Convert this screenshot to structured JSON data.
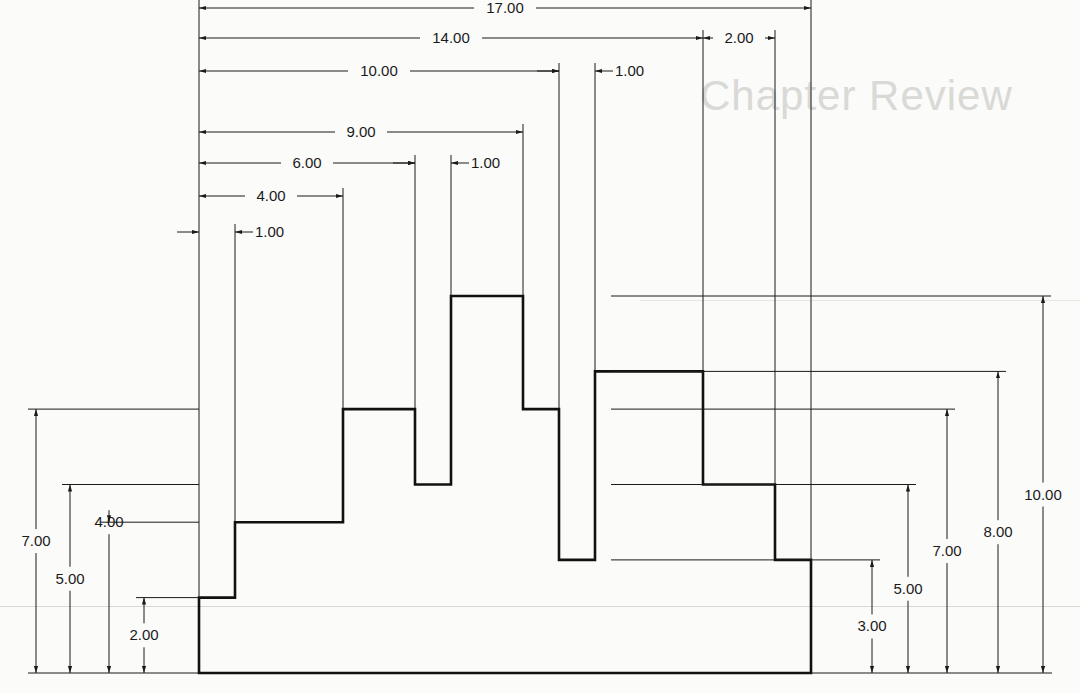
{
  "page": {
    "ghost_heading": "Chapter Review"
  },
  "drawing": {
    "units_per_px": {
      "x_px_per_unit": 36,
      "y_px_per_unit": 37.7,
      "origin_px": [
        199,
        673
      ]
    },
    "profile_points": [
      [
        0,
        0
      ],
      [
        0,
        2
      ],
      [
        1,
        2
      ],
      [
        1,
        4
      ],
      [
        4,
        4
      ],
      [
        4,
        7
      ],
      [
        6,
        7
      ],
      [
        6,
        5
      ],
      [
        7,
        5
      ],
      [
        7,
        10
      ],
      [
        9,
        10
      ],
      [
        9,
        7
      ],
      [
        10,
        7
      ],
      [
        10,
        3
      ],
      [
        11,
        3
      ],
      [
        11,
        8
      ],
      [
        14,
        8
      ],
      [
        14,
        5
      ],
      [
        16,
        5
      ],
      [
        16,
        3
      ],
      [
        17,
        3
      ],
      [
        17,
        0
      ]
    ],
    "horizontal_dimensions": [
      {
        "label": "17.00",
        "from": 0,
        "to": 17,
        "y": 8
      },
      {
        "label": "14.00",
        "from": 0,
        "to": 14,
        "y": 38
      },
      {
        "label": "2.00",
        "from": 14,
        "to": 16,
        "y": 38
      },
      {
        "label": "10.00",
        "from": 0,
        "to": 10,
        "y": 71
      },
      {
        "label": "1.00",
        "from": 10,
        "to": 11,
        "y": 71
      },
      {
        "label": "9.00",
        "from": 0,
        "to": 9,
        "y": 132
      },
      {
        "label": "6.00",
        "from": 0,
        "to": 6,
        "y": 163
      },
      {
        "label": "1.00",
        "from": 6,
        "to": 7,
        "y": 163
      },
      {
        "label": "4.00",
        "from": 0,
        "to": 4,
        "y": 196
      },
      {
        "label": "1.00",
        "from": 0,
        "to": 1,
        "y": 232
      }
    ],
    "left_dimensions": [
      {
        "label": "7.00",
        "height": 7,
        "x": 36
      },
      {
        "label": "5.00",
        "height": 5,
        "x": 70
      },
      {
        "label": "4.00",
        "height": 4,
        "x": 109
      },
      {
        "label": "2.00",
        "height": 2,
        "x": 144
      }
    ],
    "right_dimensions": [
      {
        "label": "3.00",
        "height": 3,
        "x": 872
      },
      {
        "label": "5.00",
        "height": 5,
        "x": 908
      },
      {
        "label": "7.00",
        "height": 7,
        "x": 947
      },
      {
        "label": "8.00",
        "height": 8,
        "x": 998
      },
      {
        "label": "10.00",
        "height": 10,
        "x": 1043
      }
    ]
  }
}
